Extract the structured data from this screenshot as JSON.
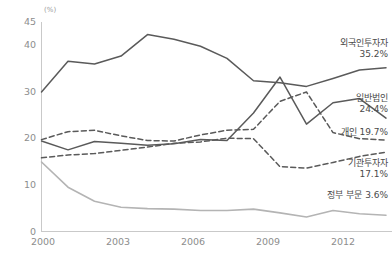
{
  "chart_data": {
    "type": "line",
    "title": "",
    "subtitle": "",
    "xlabel": "",
    "ylabel": "",
    "unit_label": "(%)",
    "xlim": [
      2000,
      2013
    ],
    "ylim": [
      0,
      45
    ],
    "yticks": [
      0,
      10,
      20,
      30,
      40,
      45
    ],
    "xticks": [
      2000,
      2003,
      2006,
      2009,
      2012
    ],
    "xtick_labels": [
      "2000",
      "2003",
      "2006",
      "2009",
      "2012"
    ],
    "ytick_labels": [
      "0",
      "10",
      "20",
      "30",
      "40",
      "45"
    ],
    "grid": false,
    "legend_position": "right-inline",
    "x": [
      2000,
      2001,
      2002,
      2003,
      2004,
      2005,
      2006,
      2007,
      2008,
      2009,
      2010,
      2011,
      2012,
      2013
    ],
    "series": [
      {
        "name": "외국인투자자",
        "end_value": "35.2%",
        "end_value_num": 35.2,
        "style": "solid",
        "color": "#5a5a5a",
        "width": 1.5,
        "values": [
          30.0,
          36.6,
          36.0,
          37.7,
          42.3,
          41.3,
          39.8,
          37.2,
          32.4,
          32.0,
          31.2,
          32.9,
          34.7,
          35.2
        ]
      },
      {
        "name": "일반법인",
        "end_value": "24.4%",
        "end_value_num": 24.4,
        "style": "solid",
        "color": "#5a5a5a",
        "width": 1.5,
        "values": [
          19.5,
          17.6,
          19.4,
          19.0,
          18.6,
          18.9,
          19.8,
          19.6,
          25.5,
          33.2,
          23.1,
          27.7,
          28.6,
          24.4
        ]
      },
      {
        "name": "개인",
        "end_value": "19.7%",
        "end_value_num": 19.7,
        "style": "dashed",
        "color": "#5a5a5a",
        "width": 1.5,
        "values": [
          19.8,
          21.5,
          21.8,
          20.6,
          19.6,
          19.5,
          20.8,
          21.8,
          22.0,
          28.0,
          30.0,
          21.3,
          20.0,
          19.7
        ]
      },
      {
        "name": "기관투자자",
        "end_value": "17.1%",
        "end_value_num": 17.1,
        "style": "dashed",
        "color": "#5a5a5a",
        "width": 1.5,
        "values": [
          15.9,
          16.5,
          16.8,
          17.5,
          18.2,
          19.0,
          19.3,
          20.1,
          20.0,
          14.0,
          13.7,
          14.9,
          16.2,
          17.1
        ]
      },
      {
        "name": "정부 부문",
        "end_value": "3.6%",
        "end_value_num": 3.6,
        "style": "solid",
        "color": "#b4b4b4",
        "width": 1.6,
        "values": [
          15.0,
          9.6,
          6.6,
          5.3,
          5.0,
          4.9,
          4.6,
          4.6,
          4.9,
          4.1,
          3.2,
          4.6,
          3.9,
          3.6
        ]
      }
    ]
  },
  "labels": {
    "foreign_name": "외국인투자자",
    "foreign_value": "35.2%",
    "corp_name": "일반법인",
    "corp_value": "24.4%",
    "individual_text": "개인 19.7%",
    "institution_name": "기관투자자",
    "institution_value": "17.1%",
    "government_text": "정부 부문 3.6%"
  },
  "axis": {
    "unit": "(%)",
    "y": [
      "45",
      "40",
      "30",
      "20",
      "10",
      "0"
    ],
    "x": [
      "2000",
      "2003",
      "2006",
      "2009",
      "2012"
    ]
  }
}
